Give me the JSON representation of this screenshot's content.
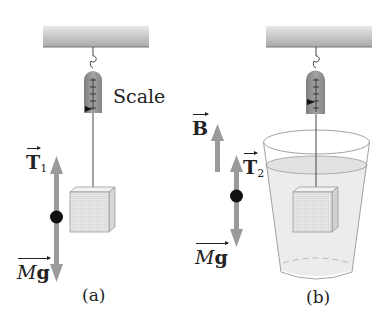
{
  "panels": [
    {
      "id": "a",
      "caption": "(a)",
      "scale_label": "Scale",
      "forces": [
        {
          "symbol": "T",
          "subscript": "1",
          "direction": "up"
        },
        {
          "symbol": "Mg",
          "direction": "down"
        }
      ]
    },
    {
      "id": "b",
      "caption": "(b)",
      "forces": [
        {
          "symbol": "B",
          "direction": "up"
        },
        {
          "symbol": "T",
          "subscript": "2",
          "direction": "up"
        },
        {
          "symbol": "Mg",
          "direction": "down"
        }
      ]
    }
  ],
  "colors": {
    "arrow": "#9a9a9a",
    "ceiling": "#b5b5b5",
    "scale_body": "#8f8f8f",
    "block": "#e4e4e4",
    "water": "#ececec",
    "dot": "#111111"
  }
}
